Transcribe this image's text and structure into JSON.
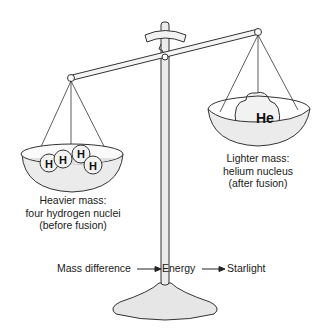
{
  "figure": {
    "left_pan": {
      "particles": [
        "H",
        "H",
        "H",
        "H"
      ],
      "label_lines": [
        "Heavier mass:",
        "four hydrogen nuclei",
        "(before fusion)"
      ]
    },
    "right_pan": {
      "particles": [
        "He"
      ],
      "label_lines": [
        "Lighter mass:",
        "helium nucleus",
        "(after fusion)"
      ]
    },
    "flow": {
      "step1": "Mass difference",
      "step2": "Energy",
      "step3": "Starlight"
    },
    "colors": {
      "line": "#333333",
      "fill": "#ebebeb",
      "particle_fill": "#f2f2f2"
    }
  }
}
